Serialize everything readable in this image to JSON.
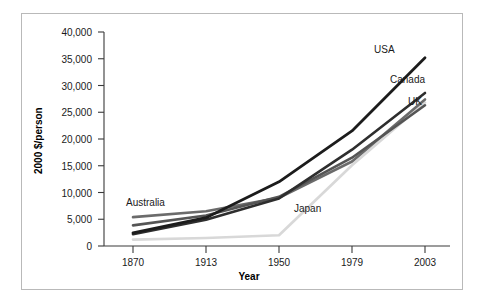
{
  "chart_data": {
    "type": "line",
    "title": "",
    "xlabel": "Year",
    "ylabel": "2000 $/person",
    "categories": [
      "1870",
      "1913",
      "1950",
      "1979",
      "2003"
    ],
    "x": [
      1870,
      1913,
      1950,
      1979,
      2003
    ],
    "ylim": [
      0,
      40000
    ],
    "yticks": [
      0,
      5000,
      10000,
      15000,
      20000,
      25000,
      30000,
      35000,
      40000
    ],
    "ytick_labels": [
      "0",
      "5,000",
      "10,000",
      "15,000",
      "20,000",
      "25,000",
      "30,000",
      "35,000",
      "40,000"
    ],
    "grid": false,
    "legend_position": "inline-labels",
    "series": [
      {
        "name": "USA",
        "color": "#1c1c1c",
        "values": [
          2450,
          5300,
          12000,
          21500,
          35200
        ],
        "label_position": "end-above"
      },
      {
        "name": "Canada",
        "color": "#2e2e2e",
        "values": [
          2200,
          4900,
          8900,
          18000,
          28600
        ],
        "label_position": "end-above"
      },
      {
        "name": "UK",
        "color": "#555555",
        "values": [
          3850,
          5700,
          9200,
          16500,
          26300
        ],
        "label_position": "end-above"
      },
      {
        "name": "Australia",
        "color": "#6b6b6b",
        "values": [
          5400,
          6500,
          9000,
          15800,
          27400
        ],
        "label_position": "start-above"
      },
      {
        "name": "Japan",
        "color": "#d8d8d8",
        "values": [
          1200,
          1500,
          2000,
          15100,
          26800
        ],
        "label_position": "mid-below"
      }
    ],
    "annotations": [
      {
        "text": "USA",
        "x": 2003,
        "y": 35200
      },
      {
        "text": "Canada",
        "x": 2003,
        "y": 28600
      },
      {
        "text": "UK",
        "x": 2003,
        "y": 26300
      },
      {
        "text": "Australia",
        "x": 1870,
        "y": 5400
      },
      {
        "text": "Japan",
        "x": 1979,
        "y": 6500
      }
    ]
  },
  "axes": {
    "x_tick_labels": [
      "1870",
      "1913",
      "1950",
      "1979",
      "2003"
    ],
    "y_tick_labels": [
      "40,000",
      "35,000",
      "30,000",
      "25,000",
      "20,000",
      "15,000",
      "10,000",
      "5,000",
      "0"
    ],
    "x_title": "Year",
    "y_title": "2000 $/person"
  },
  "labels": {
    "usa": "USA",
    "canada": "Canada",
    "uk": "UK",
    "australia": "Australia",
    "japan": "Japan"
  }
}
